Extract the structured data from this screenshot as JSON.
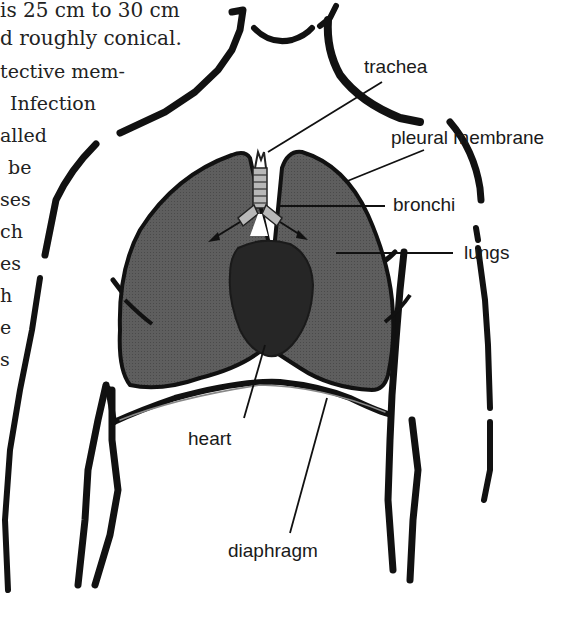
{
  "text_fragment": {
    "lines": [
      "is 25 cm to 30 cm",
      "d roughly conical.",
      "tective mem-",
      "Infection",
      "alled",
      "be",
      "ses",
      "ch",
      "es",
      "h",
      "e",
      "s"
    ]
  },
  "diagram": {
    "labels": {
      "trachea": "trachea",
      "pleural_membrane": "pleural membrane",
      "bronchi": "bronchi",
      "lungs": "lungs",
      "heart": "heart",
      "diaphragm": "diaphragm"
    },
    "colors": {
      "outline": "#111111",
      "lung_fill": "#5e5e5e",
      "heart_fill": "#262626",
      "trachea_fill": "#b8b8b8",
      "background": "#ffffff"
    }
  }
}
